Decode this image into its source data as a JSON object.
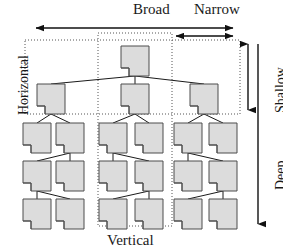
{
  "figure": {
    "width": 283,
    "height": 252
  },
  "labels": {
    "broad": "Broad",
    "narrow": "Narrow",
    "horizontal": "Horizontal",
    "shallow": "Shallow",
    "deep": "Deep",
    "vertical": "Vertical"
  },
  "colors": {
    "node_fill": "#dcdcdc",
    "node_stroke": "#4d4d4d",
    "connector": "#1a1a1a",
    "dotted_region": "#555555",
    "arrow": "#111111",
    "background": "#ffffff"
  },
  "regions": [
    {
      "name": "horizontal-region",
      "style": "dotted",
      "x": 25,
      "y": 40,
      "width": 215,
      "height": 74
    },
    {
      "name": "vertical-region",
      "style": "dotted",
      "x": 98,
      "y": 33,
      "width": 74,
      "height": 193
    }
  ],
  "arrows": [
    {
      "name": "broad-arrow",
      "label": "Broad",
      "orientation": "horizontal",
      "direction": "both",
      "x1": 36,
      "y1": 28,
      "x2": 233,
      "y2": 28
    },
    {
      "name": "narrow-arrow",
      "label": "Narrow",
      "orientation": "horizontal",
      "direction": "both",
      "x1": 176,
      "y1": 36,
      "x2": 233,
      "y2": 36
    },
    {
      "name": "shallow-arrow",
      "label": "Shallow",
      "orientation": "vertical",
      "direction": "both",
      "x1": 248,
      "y1": 44,
      "x2": 248,
      "y2": 110
    },
    {
      "name": "deep-arrow",
      "label": "Deep",
      "orientation": "vertical",
      "direction": "down",
      "x1": 258,
      "y1": 44,
      "x2": 258,
      "y2": 224
    }
  ],
  "tree": {
    "node_shape": "document-folded-corner",
    "node_size": {
      "width": 28,
      "height": 30
    },
    "levels": [
      {
        "level": 1,
        "name": "root-level",
        "nodes": [
          {
            "id": "n1",
            "x": 135,
            "y": 46
          }
        ]
      },
      {
        "level": 2,
        "name": "level-2",
        "nodes": [
          {
            "id": "n2",
            "x": 51,
            "y": 84
          },
          {
            "id": "n3",
            "x": 135,
            "y": 84
          },
          {
            "id": "n4",
            "x": 204,
            "y": 84
          }
        ]
      },
      {
        "level": 3,
        "name": "level-3",
        "nodes": [
          {
            "id": "n5",
            "x": 37,
            "y": 123
          },
          {
            "id": "n6",
            "x": 70,
            "y": 123
          },
          {
            "id": "n7",
            "x": 113,
            "y": 123
          },
          {
            "id": "n8",
            "x": 149,
            "y": 123
          },
          {
            "id": "n9",
            "x": 188,
            "y": 123
          },
          {
            "id": "n10",
            "x": 223,
            "y": 123
          }
        ]
      },
      {
        "level": 4,
        "name": "level-4",
        "nodes": [
          {
            "id": "n11",
            "x": 37,
            "y": 161
          },
          {
            "id": "n12",
            "x": 70,
            "y": 161
          },
          {
            "id": "n13",
            "x": 113,
            "y": 161
          },
          {
            "id": "n14",
            "x": 149,
            "y": 161
          },
          {
            "id": "n15",
            "x": 188,
            "y": 161
          },
          {
            "id": "n16",
            "x": 223,
            "y": 161
          }
        ]
      },
      {
        "level": 5,
        "name": "level-5",
        "nodes": [
          {
            "id": "n17",
            "x": 37,
            "y": 199
          },
          {
            "id": "n18",
            "x": 70,
            "y": 199
          },
          {
            "id": "n19",
            "x": 113,
            "y": 199
          },
          {
            "id": "n20",
            "x": 149,
            "y": 199
          },
          {
            "id": "n21",
            "x": 188,
            "y": 199
          },
          {
            "id": "n22",
            "x": 223,
            "y": 199
          }
        ]
      }
    ],
    "edges": [
      {
        "from": "n1",
        "to": "n2"
      },
      {
        "from": "n1",
        "to": "n3"
      },
      {
        "from": "n1",
        "to": "n4"
      },
      {
        "from": "n2",
        "to": "n5"
      },
      {
        "from": "n2",
        "to": "n6"
      },
      {
        "from": "n3",
        "to": "n7"
      },
      {
        "from": "n3",
        "to": "n8"
      },
      {
        "from": "n4",
        "to": "n9"
      },
      {
        "from": "n4",
        "to": "n10"
      },
      {
        "from": "n6",
        "to": "n11"
      },
      {
        "from": "n6",
        "to": "n12"
      },
      {
        "from": "n7",
        "to": "n13"
      },
      {
        "from": "n7",
        "to": "n14"
      },
      {
        "from": "n9",
        "to": "n15"
      },
      {
        "from": "n9",
        "to": "n16"
      },
      {
        "from": "n11",
        "to": "n17"
      },
      {
        "from": "n11",
        "to": "n18"
      },
      {
        "from": "n14",
        "to": "n19"
      },
      {
        "from": "n14",
        "to": "n20"
      },
      {
        "from": "n16",
        "to": "n21"
      },
      {
        "from": "n16",
        "to": "n22"
      }
    ]
  }
}
